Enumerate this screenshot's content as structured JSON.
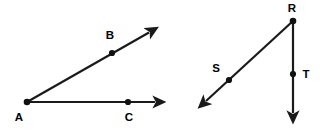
{
  "figure": {
    "background_color": "#ffffff",
    "stroke_color": "#1a1a1a",
    "label_color": "#000000",
    "width": 326,
    "height": 131
  },
  "diagrams": [
    {
      "name": "angle-BAC",
      "description": "Angle with vertex A and two rays AB and AC",
      "vertex": "A",
      "rays": [
        "AB",
        "AC"
      ],
      "points": [
        {
          "label": "A",
          "role": "vertex",
          "dot_x": 27,
          "dot_y": 102,
          "label_x": 19,
          "label_y": 118
        },
        {
          "label": "B",
          "role": "ray-point",
          "dot_x": 112,
          "dot_y": 49,
          "label_x": 109,
          "label_y": 36
        },
        {
          "label": "C",
          "role": "ray-point",
          "dot_x": 128,
          "dot_y": 102,
          "label_x": 128,
          "label_y": 118
        }
      ],
      "segments": [
        {
          "name": "ray-AB",
          "x1": 27,
          "y1": 102,
          "x2": 152,
          "y2": 30,
          "arrow_at_end": true,
          "arrow_at_start": false
        },
        {
          "name": "ray-AC",
          "x1": 27,
          "y1": 102,
          "x2": 159,
          "y2": 102,
          "arrow_at_end": true,
          "arrow_at_start": false
        }
      ]
    },
    {
      "name": "angle-SRT",
      "description": "Angle with vertex R and two rays RS and RT",
      "vertex": "R",
      "rays": [
        "RS",
        "RT"
      ],
      "points": [
        {
          "label": "R",
          "role": "vertex",
          "dot_x": 293,
          "dot_y": 21,
          "label_x": 292,
          "label_y": 8
        },
        {
          "label": "S",
          "role": "ray-point",
          "dot_x": 229,
          "dot_y": 80,
          "label_x": 216,
          "label_y": 69
        },
        {
          "label": "T",
          "role": "ray-point",
          "dot_x": 293,
          "dot_y": 74,
          "label_x": 305,
          "label_y": 75
        }
      ],
      "segments": [
        {
          "name": "ray-RS",
          "x1": 293,
          "y1": 21,
          "x2": 203,
          "y2": 104,
          "arrow_at_end": true,
          "arrow_at_start": false
        },
        {
          "name": "ray-RT",
          "x1": 293,
          "y1": 21,
          "x2": 293,
          "y2": 117,
          "arrow_at_end": true,
          "arrow_at_start": false
        }
      ]
    }
  ],
  "labels": {
    "a": "A",
    "b": "B",
    "c": "C",
    "r": "R",
    "s": "S",
    "t": "T"
  }
}
